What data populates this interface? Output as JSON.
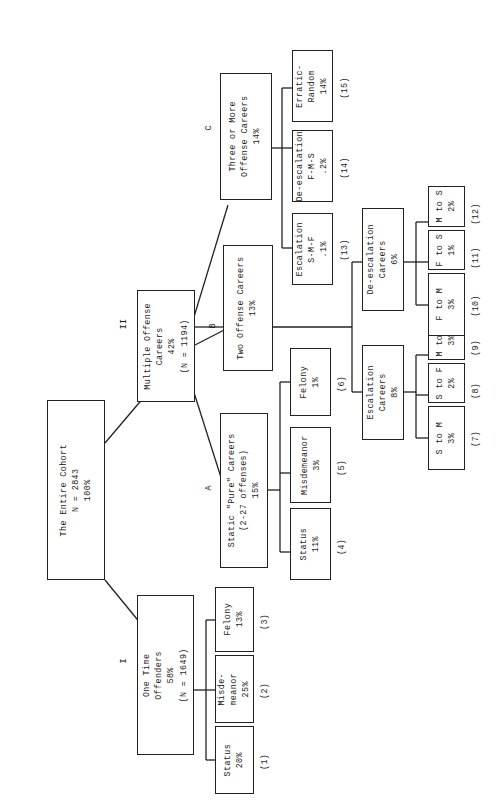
{
  "diagram": {
    "orientation": "rotated-90-ccw",
    "root": {
      "id": "root",
      "text": "The Entire Cohort\nN = 2843\n100%",
      "label": ""
    },
    "nodes": [
      {
        "id": "one-time-offenders",
        "text": "One Time\nOffenders\n58%\n(N = 1649)",
        "label": "I"
      },
      {
        "id": "multiple-offense-careers",
        "text": "Multiple Offense\nCareers\n42%\n(N = 1194)",
        "label": "II"
      },
      {
        "id": "status-1",
        "text": "Status\n20%",
        "label": "(1)"
      },
      {
        "id": "misdemeanor-2",
        "text": "Misde-\nmeanor\n25%",
        "label": "(2)"
      },
      {
        "id": "felony-3",
        "text": "Felony\n13%",
        "label": "(3)"
      },
      {
        "id": "static-pure-careers",
        "text": "Static \"Pure\" Careers\n(2-27 offenses)\n15%",
        "label": "A"
      },
      {
        "id": "two-offense-careers",
        "text": "Two Offense Careers\n13%",
        "label": "B"
      },
      {
        "id": "three-or-more-offense-careers",
        "text": "Three or More\nOffense Careers\n14%",
        "label": "C"
      },
      {
        "id": "status-4",
        "text": "Status\n11%",
        "label": "(4)"
      },
      {
        "id": "misdemeanor-5",
        "text": "Misdemeanor\n3%",
        "label": "(5)"
      },
      {
        "id": "felony-6",
        "text": "Felony\n1%",
        "label": "(6)"
      },
      {
        "id": "escalation-careers",
        "text": "Escalation\nCareers\n8%",
        "label": ""
      },
      {
        "id": "de-escalation-careers",
        "text": "De-escalation\nCareers\n6%",
        "label": ""
      },
      {
        "id": "s-to-m-7",
        "text": "S to M\n3%",
        "label": "(7)"
      },
      {
        "id": "s-to-f-8",
        "text": "S to F\n2%",
        "label": "(8)"
      },
      {
        "id": "m-to-f-9",
        "text": "M to F\n3%",
        "label": "(9)"
      },
      {
        "id": "f-to-m-10",
        "text": "F to M\n3%",
        "label": "(10)"
      },
      {
        "id": "f-to-s-11",
        "text": "F to S\n1%",
        "label": "(11)"
      },
      {
        "id": "m-to-s-12",
        "text": "M to S\n2%",
        "label": "(12)"
      },
      {
        "id": "escalation-smf-13",
        "text": "Escalation\nS-M-F\n.1%",
        "label": "(13)"
      },
      {
        "id": "de-escalation-fms-14",
        "text": "De-escalation\nF-M-S\n.2%",
        "label": "(14)"
      },
      {
        "id": "erratic-random-15",
        "text": "Erratic-\nRandom\n14%",
        "label": "(15)"
      }
    ],
    "colors": {
      "stroke": "#222222",
      "background": "#ffffff",
      "text": "#1a1a1a"
    }
  }
}
